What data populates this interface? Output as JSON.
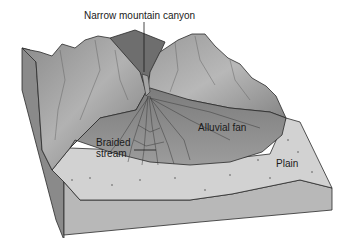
{
  "diagram": {
    "labels": {
      "canyon": "Narrow mountain canyon",
      "fan": "Alluvial fan",
      "stream_line1": "Braided",
      "stream_line2": "stream",
      "plain": "Plain"
    },
    "colors": {
      "mountain_dark": "#6e6e6e",
      "mountain_light": "#a8a8a8",
      "fan": "#8c8c8c",
      "plain_top": "#cfcfcf",
      "block_side": "#b4b4b4",
      "outline": "#2a2a2a"
    }
  }
}
